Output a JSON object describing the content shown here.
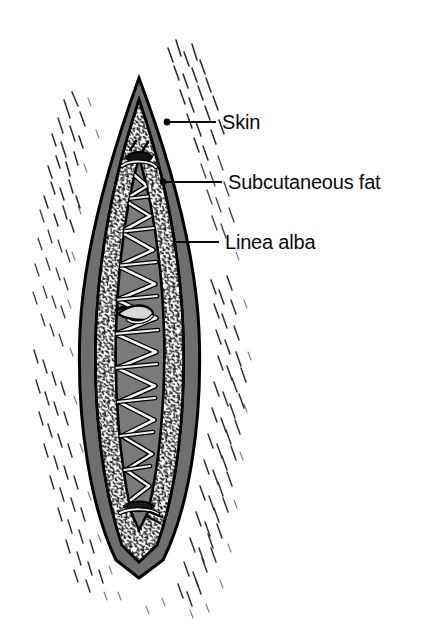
{
  "figure": {
    "background_color": "#ffffff"
  },
  "labels": [
    {
      "id": "skin",
      "text": "Skin",
      "text_x": 222,
      "text_y": 129,
      "leader_from_x": 167,
      "leader_from_y": 122,
      "leader_to_x": 216,
      "leader_to_y": 122,
      "marker": "dot"
    },
    {
      "id": "subcutaneous-fat",
      "text": "Subcutaneous fat",
      "text_x": 228,
      "text_y": 189,
      "leader_from_x": 163,
      "leader_from_y": 182,
      "leader_to_x": 222,
      "leader_to_y": 182,
      "marker": "dot"
    },
    {
      "id": "linea-alba",
      "text": "Linea alba",
      "text_x": 225,
      "text_y": 249,
      "leader_from_x": 173,
      "leader_from_y": 242,
      "leader_to_x": 219,
      "leader_to_y": 242,
      "marker": "none"
    }
  ],
  "anatomy": {
    "layers": [
      {
        "id": "skin-band",
        "name": "Skin",
        "fill": "#6e6e6e",
        "stroke": "#000000"
      },
      {
        "id": "subcutaneous-fat-band",
        "name": "Subcutaneous fat",
        "fill": "#ffffff",
        "stroke": "#000000"
      },
      {
        "id": "linea-alba-body",
        "name": "Linea alba",
        "fill": "#7a7a7a",
        "stroke": "#000000"
      }
    ],
    "suture": {
      "name": "Continuous running suture",
      "strand_fill": "#f2f2f2",
      "strand_stroke": "#000000",
      "stitch_count": 16,
      "knot_positions": [
        "top",
        "middle",
        "bottom"
      ]
    },
    "wound": {
      "apex_top_y": 78,
      "apex_bottom_y": 572,
      "center_x": 139,
      "max_half_width": 66
    }
  },
  "colors": {
    "ink": "#0b0b0b",
    "skin_gray": "#6e6e6e",
    "linea_gray": "#7a7a7a",
    "fat_white": "#ffffff",
    "paper": "#ffffff"
  }
}
